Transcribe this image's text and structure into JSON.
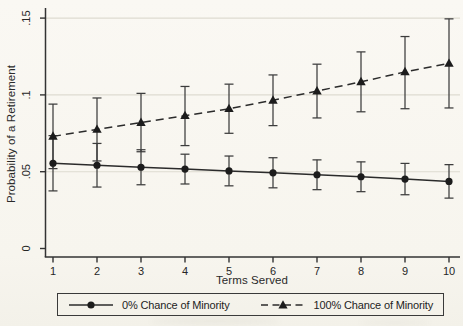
{
  "chart_data": {
    "type": "line",
    "title": "",
    "xlabel": "Terms Served",
    "ylabel": "Probability of a Retirement",
    "x": [
      1,
      2,
      3,
      4,
      5,
      6,
      7,
      8,
      9,
      10
    ],
    "xtick_labels": [
      "1",
      "2",
      "3",
      "4",
      "5",
      "6",
      "7",
      "8",
      "9",
      "10"
    ],
    "ylim": [
      0,
      0.15
    ],
    "yticks": [
      0,
      0.05,
      0.1,
      0.15
    ],
    "ytick_labels": [
      "0",
      ".05",
      ".1",
      ".15"
    ],
    "grid": true,
    "grid_axis": "y",
    "legend_position": "bottom",
    "error_bars": true,
    "series": [
      {
        "name": "0% Chance of Minority",
        "marker": "circle",
        "line_style": "solid",
        "values": [
          0.0555,
          0.0542,
          0.0529,
          0.0517,
          0.0505,
          0.0493,
          0.048,
          0.0467,
          0.0452,
          0.0437
        ],
        "ci_low": [
          0.0375,
          0.04,
          0.0415,
          0.042,
          0.0408,
          0.0395,
          0.0383,
          0.037,
          0.035,
          0.0328
        ],
        "ci_high": [
          0.0735,
          0.0684,
          0.0643,
          0.0614,
          0.0602,
          0.0591,
          0.0577,
          0.0564,
          0.0554,
          0.0546
        ]
      },
      {
        "name": "100% Chance of Minority",
        "marker": "triangle",
        "line_style": "dashed",
        "values": [
          0.073,
          0.0775,
          0.082,
          0.0865,
          0.091,
          0.0965,
          0.1025,
          0.1085,
          0.115,
          0.1205
        ],
        "ci_low": [
          0.052,
          0.057,
          0.063,
          0.067,
          0.075,
          0.08,
          0.085,
          0.089,
          0.091,
          0.0915
        ],
        "ci_high": [
          0.094,
          0.098,
          0.101,
          0.1055,
          0.107,
          0.113,
          0.12,
          0.128,
          0.138,
          0.1495
        ]
      }
    ]
  },
  "colors": {
    "background": "#f8f6f0",
    "ink": "#333333",
    "marker_fill": "#1c1c1c",
    "grid": "#dedbd1",
    "text": "#262626"
  }
}
